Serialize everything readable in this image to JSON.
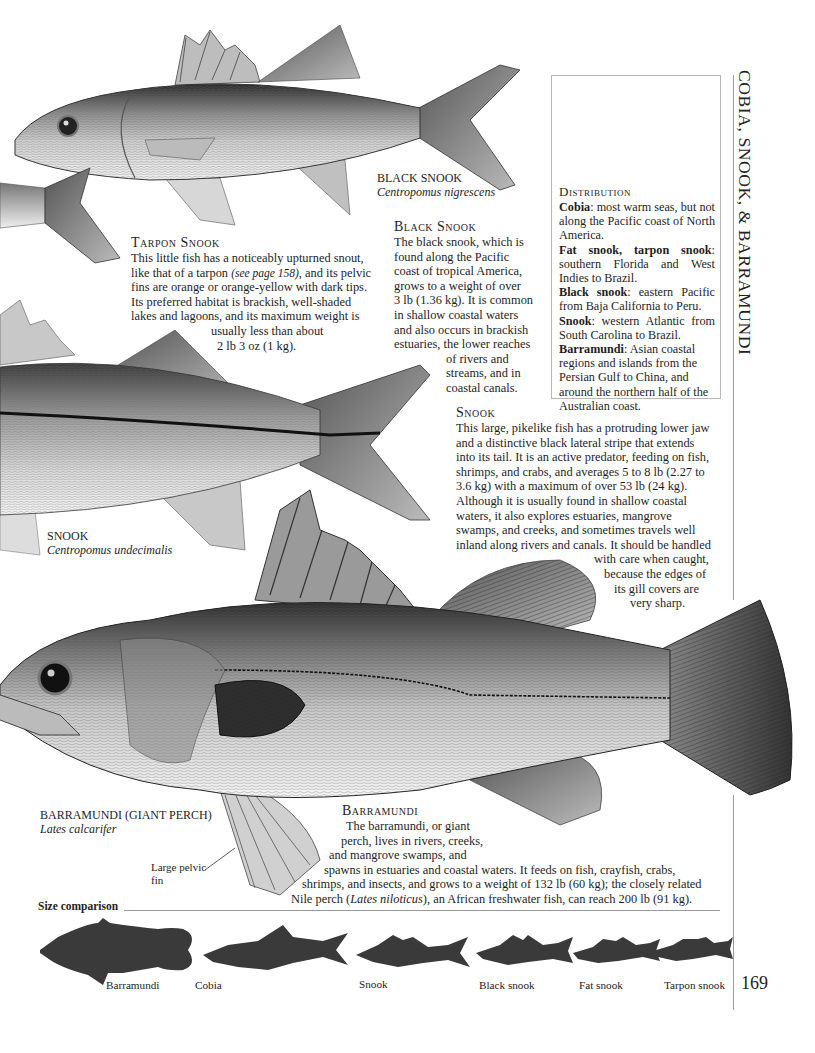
{
  "running_head": "COBIA, SNOOK, & BARRAMUNDI",
  "page_number": "169",
  "black_snook_caption": {
    "common_name": "BLACK SNOOK",
    "latin_name": "Centropomus nigrescens"
  },
  "snook_caption": {
    "common_name": "SNOOK",
    "latin_name": "Centropomus undecimalis"
  },
  "barramundi_caption": {
    "common_name": "BARRAMUNDI (GIANT PERCH)",
    "latin_name": "Lates calcarifer"
  },
  "pelvic_fin_annotation": {
    "line1": "Large pelvic",
    "line2": "fin"
  },
  "tarpon_snook": {
    "heading": "Tarpon Snook",
    "lines": [
      "This little fish has a noticeably upturned snout,",
      "like that of a tarpon",
      "(see page 158)",
      ", and its pelvic",
      "fins are orange or orange-yellow with dark tips.",
      "Its preferred habitat is brackish, well-shaded",
      "lakes and lagoons, and its maximum weight is",
      "usually less than about",
      "2 lb 3 oz (1 kg)."
    ]
  },
  "black_snook": {
    "heading": "Black Snook",
    "lines": [
      "The black snook, which is",
      "found along the Pacific",
      "coast of tropical America,",
      "grows to a weight of over",
      "3 lb (1.36 kg). It is common",
      "in shallow coastal waters",
      "and also occurs in brackish",
      "estuaries, the lower reaches",
      "of rivers and",
      "streams, and in",
      "coastal canals."
    ]
  },
  "snook": {
    "heading": "Snook",
    "lines": [
      "This large, pikelike fish has a protruding lower jaw",
      "and a distinctive black lateral stripe that extends",
      "into its tail. It is an active predator, feeding on fish,",
      "shrimps, and crabs, and averages 5 to 8 lb (2.27 to",
      "3.6 kg) with a maximum of over 53 lb (24 kg).",
      "Although it is usually found in shallow coastal",
      "waters, it also explores estuaries, mangrove",
      "swamps, and creeks, and sometimes travels well",
      "inland along rivers and canals. It should be handled",
      "with care when caught,",
      "because the edges of",
      "its gill covers are",
      "very sharp."
    ]
  },
  "barramundi": {
    "heading": "Barramundi",
    "lines": [
      "The barramundi, or giant",
      "perch, lives in rivers, creeks,",
      "and mangrove swamps, and",
      "spawns in estuaries and coastal waters. It feeds on fish, crayfish, crabs,",
      "shrimps, and insects, and grows to a weight of 132 lb (60 kg); the closely related",
      "Nile perch (",
      "Lates niloticus",
      "), an African freshwater fish, can reach 200 lb (91 kg)."
    ]
  },
  "distribution": {
    "heading": "Distribution",
    "entries": [
      {
        "name": "Cobia",
        "text": ": most warm seas, but not along the Pacific coast of North America."
      },
      {
        "name": "Fat snook, tarpon snook",
        "text": ": southern Florida and West Indies to Brazil."
      },
      {
        "name": "Black snook",
        "text": ": eastern Pacific from Baja California to Peru."
      },
      {
        "name": "Snook",
        "text": ": western Atlantic from South Carolina to Brazil."
      },
      {
        "name": "Barramundi",
        "text": ": Asian coastal regions and islands from the Persian Gulf to China, and around the northern half of the Australian coast."
      }
    ]
  },
  "size_comparison": {
    "label": "Size comparison",
    "silhouettes": [
      {
        "name": "Barramundi",
        "icon": "barramundi-silhouette"
      },
      {
        "name": "Cobia",
        "icon": "cobia-silhouette"
      },
      {
        "name": "Snook",
        "icon": "snook-silhouette"
      },
      {
        "name": "Black snook",
        "icon": "black-snook-silhouette"
      },
      {
        "name": "Fat snook",
        "icon": "fat-snook-silhouette"
      },
      {
        "name": "Tarpon snook",
        "icon": "tarpon-snook-silhouette"
      }
    ]
  },
  "colors": {
    "ink": "#1e1e1e",
    "silhouette": "#3a3a3a",
    "rule": "#9a9a9a"
  }
}
